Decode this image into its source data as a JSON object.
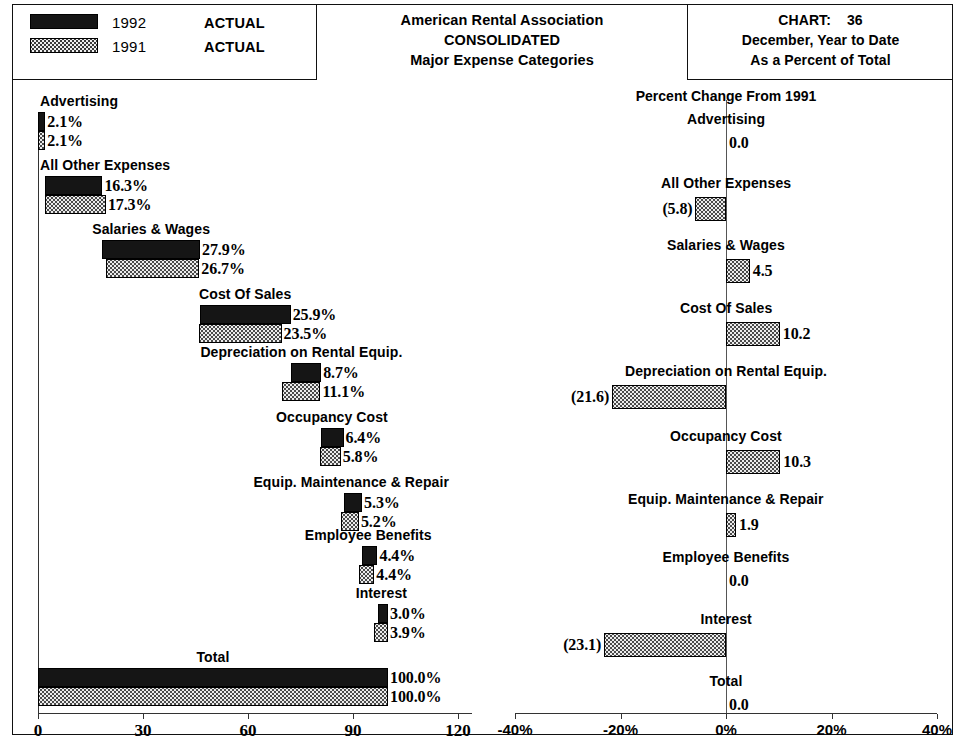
{
  "legend": {
    "rows": [
      {
        "year": "1992",
        "kind": "ACTUAL",
        "swatch": "solid-black-swatch"
      },
      {
        "year": "1991",
        "kind": "ACTUAL",
        "swatch": "dotted-gray-swatch"
      }
    ]
  },
  "title": {
    "line1": "American Rental Association",
    "line2": "CONSOLIDATED",
    "line3": "Major Expense Categories"
  },
  "chart_info": {
    "chart_label": "CHART:",
    "chart_number": "36",
    "period": "December, Year to Date",
    "basis": "As a Percent of Total"
  },
  "right_panel_header": "Percent Change From 1991",
  "chart_data": [
    {
      "type": "bar",
      "id": "percent-of-total",
      "title": "Major Expense Categories - As a Percent of Total",
      "orientation": "horizontal",
      "layout": "staggered-cascade",
      "xlabel": "",
      "ylabel": "",
      "xlim": [
        0,
        120
      ],
      "xticks": [
        0,
        30,
        60,
        90,
        120
      ],
      "xticklabels": [
        "0",
        "30",
        "60",
        "90",
        "120"
      ],
      "grid": false,
      "legend": [
        "1992 ACTUAL",
        "1991 ACTUAL"
      ],
      "categories": [
        "Advertising",
        "All Other Expenses",
        "Salaries & Wages",
        "Cost Of Sales",
        "Depreciation on Rental Equip.",
        "Occupancy Cost",
        "Equip. Maintenance & Repair",
        "Employee Benefits",
        "Interest",
        "Total"
      ],
      "series": [
        {
          "name": "1992",
          "values": [
            2.1,
            16.3,
            27.9,
            25.9,
            8.7,
            6.4,
            5.3,
            4.4,
            3.0,
            100.0
          ],
          "labels": [
            "2.1%",
            "16.3%",
            "27.9%",
            "25.9%",
            "8.7%",
            "6.4%",
            "5.3%",
            "4.4%",
            "3.0%",
            "100.0%"
          ]
        },
        {
          "name": "1991",
          "values": [
            2.1,
            17.3,
            26.7,
            23.5,
            11.1,
            5.8,
            5.2,
            4.4,
            3.9,
            100.0
          ],
          "labels": [
            "2.1%",
            "17.3%",
            "26.7%",
            "23.5%",
            "11.1%",
            "5.8%",
            "5.2%",
            "4.4%",
            "3.9%",
            "100.0%"
          ]
        }
      ]
    },
    {
      "type": "bar",
      "id": "percent-change",
      "title": "Percent Change From 1991",
      "orientation": "horizontal",
      "xlabel": "",
      "ylabel": "",
      "xlim": [
        -40,
        40
      ],
      "xticks": [
        -40,
        -20,
        0,
        20,
        40
      ],
      "xticklabels": [
        "-40%",
        "-20%",
        "0%",
        "20%",
        "40%"
      ],
      "grid": false,
      "zero_line": 0,
      "categories": [
        "Advertising",
        "All Other Expenses",
        "Salaries & Wages",
        "Cost Of Sales",
        "Depreciation on Rental Equip.",
        "Occupancy Cost",
        "Equip. Maintenance & Repair",
        "Employee Benefits",
        "Interest",
        "Total"
      ],
      "values": [
        0.0,
        -5.8,
        4.5,
        10.2,
        -21.6,
        10.3,
        1.9,
        0.0,
        -23.1,
        0.0
      ],
      "labels": [
        "0.0",
        "(5.8)",
        "4.5",
        "10.2",
        "(21.6)",
        "10.3",
        "1.9",
        "0.0",
        "(23.1)",
        "0.0"
      ]
    }
  ]
}
